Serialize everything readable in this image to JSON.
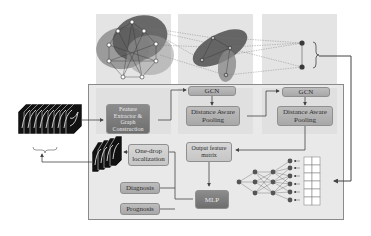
{
  "diagram": {
    "title": "",
    "panels": {
      "graph_level_1": {
        "nodes": 9,
        "clusters": 2
      },
      "graph_level_2": {
        "nodes": 3,
        "clusters": 2
      },
      "graph_level_3": {
        "nodes": 2,
        "bracket": "}"
      }
    },
    "boxes": {
      "feature_extractor": "Feature Extractor & Graph Construction",
      "gcn_1": "GCN",
      "gcn_2": "GCN",
      "pooling_1": "Distance Aware Pooling",
      "pooling_2": "Distance Aware Pooling",
      "output_feature_matrix": "Output feature matrix",
      "one_drop_localization": "One-drop localization",
      "diagnosis": "Diagnosis",
      "prognosis": "Prognosis",
      "mlp": "MLP"
    },
    "inputs": {
      "ct_stack_label": "input image slices",
      "localized_stack_label": "localized slices"
    },
    "neural_network": {
      "layers": [
        1,
        3,
        3,
        6
      ],
      "input_grid": {
        "rows": 6,
        "cols": 2
      }
    },
    "colors": {
      "panel_bg": "#e4e4e4",
      "cluster_dark": "#5a5a5a",
      "cluster_mid": "#8a8a8a",
      "box_dark": "#7a7a7a",
      "box_light": "#cfcfcf",
      "arrow": "#444444"
    }
  }
}
